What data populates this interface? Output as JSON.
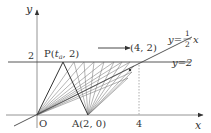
{
  "diagram": {
    "axes": {
      "x_label": "x",
      "y_label": "y",
      "origin_label": "O",
      "y_tick_label": "2",
      "x_tick_label": "4"
    },
    "points": {
      "P": {
        "label_name": "P",
        "label_sub": "a",
        "label_prefix": "P(",
        "label_suffix": ", 2)",
        "t": "t",
        "y": 2
      },
      "A": {
        "label": "A(2, 0)",
        "x": 2,
        "y": 0
      },
      "B": {
        "label": "(4, 2)",
        "x": 4,
        "y": 2
      }
    },
    "lines": {
      "half_x": {
        "prefix": "y=",
        "num": "1",
        "den": "2",
        "var": "x"
      },
      "y2": {
        "label": "y=2"
      }
    },
    "colors": {
      "stroke": "#333333",
      "thin": "#666666",
      "axis": "#888888"
    }
  }
}
